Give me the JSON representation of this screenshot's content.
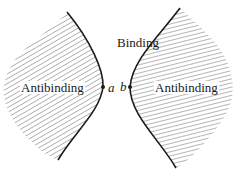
{
  "diagram": {
    "regions": {
      "binding": {
        "label": "Binding"
      },
      "left_antibinding": {
        "label": "Antibinding"
      },
      "right_antibinding": {
        "label": "Antibinding"
      }
    },
    "points": {
      "a": {
        "label": "a"
      },
      "b": {
        "label": "b"
      }
    },
    "colors": {
      "boundary": "#1a1a1a",
      "hatch": "#7a7a7a",
      "background": "#ffffff"
    }
  }
}
